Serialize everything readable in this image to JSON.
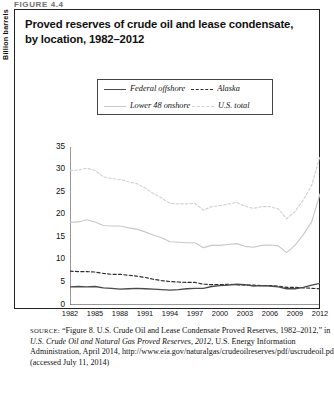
{
  "figure_label": "FIGURE 4.4",
  "chart_title": "Proved reserves of crude oil and lease condensate, by location, 1982–2012",
  "legend": {
    "items": [
      {
        "label": "Federal offshore",
        "style": "solid",
        "color": "#4a4a4a",
        "width": 1.4
      },
      {
        "label": "Alaska",
        "style": "dashed",
        "color": "#2e2e2e",
        "width": 1.2
      },
      {
        "label": "Lower 48 onshore",
        "style": "solid",
        "color": "#c8c8c8",
        "width": 1.2
      },
      {
        "label": "U.S. total",
        "style": "dotted",
        "color": "#d2d2d2",
        "width": 1.2
      }
    ]
  },
  "axes": {
    "ylabel": "Billion barrels",
    "yticks": [
      0,
      5,
      10,
      15,
      20,
      25,
      30,
      35
    ],
    "ylim": [
      0,
      35
    ],
    "xticks": [
      "1982",
      "1985",
      "1988",
      "1991",
      "1994",
      "1997",
      "2000",
      "2003",
      "2006",
      "2009",
      "2012"
    ],
    "xlim": [
      1982,
      2012
    ]
  },
  "source": {
    "prefix": "SOURCE:",
    "line1": " “Figure 8. U.S. Crude Oil and Lease Condensate Proved Reserves, 1982–2012,” in ",
    "italic1": "U.S. Crude Oil and Natural Gas Proved Reserves, 2012",
    "line2": ", U.S. Energy Information Administration, April 2014, http://www.eia.gov/naturalgas/crudeoilreserves/pdf/uscrudeoil.pdf (accessed July 11, 2014)"
  },
  "chart_data": {
    "type": "line",
    "title": "Proved reserves of crude oil and lease condensate, by location, 1982–2012",
    "xlabel": "",
    "ylabel": "Billion barrels",
    "ylim": [
      0,
      35
    ],
    "xlim": [
      1982,
      2012
    ],
    "grid": false,
    "legend_position": "top-center",
    "x": [
      1982,
      1983,
      1984,
      1985,
      1986,
      1987,
      1988,
      1989,
      1990,
      1991,
      1992,
      1993,
      1994,
      1995,
      1996,
      1997,
      1998,
      1999,
      2000,
      2001,
      2002,
      2003,
      2004,
      2005,
      2006,
      2007,
      2008,
      2009,
      2010,
      2011,
      2012
    ],
    "series": [
      {
        "name": "U.S. total",
        "style": "dotted",
        "color": "#d2d2d2",
        "values": [
          29.8,
          29.9,
          30.3,
          29.8,
          28.4,
          28.0,
          27.8,
          27.3,
          26.9,
          25.9,
          24.7,
          23.7,
          22.5,
          22.4,
          22.4,
          22.5,
          21.0,
          21.8,
          22.0,
          22.4,
          22.7,
          21.9,
          21.4,
          21.8,
          21.8,
          21.3,
          19.1,
          20.7,
          23.3,
          26.5,
          33.0
        ]
      },
      {
        "name": "Lower 48 onshore",
        "style": "solid",
        "color": "#c8c8c8",
        "values": [
          18.3,
          18.4,
          18.9,
          18.4,
          17.6,
          17.5,
          17.5,
          17.1,
          16.8,
          16.2,
          15.5,
          14.9,
          14.0,
          13.9,
          13.8,
          13.8,
          12.7,
          13.2,
          13.2,
          13.4,
          13.6,
          13.0,
          12.8,
          13.2,
          13.3,
          13.1,
          11.6,
          13.2,
          15.6,
          18.4,
          24.6
        ]
      },
      {
        "name": "Alaska",
        "style": "dashed",
        "color": "#2e2e2e",
        "values": [
          7.5,
          7.4,
          7.4,
          7.3,
          7.0,
          6.8,
          6.8,
          6.6,
          6.4,
          6.1,
          5.7,
          5.4,
          5.2,
          5.1,
          5.0,
          5.0,
          4.6,
          4.5,
          4.5,
          4.6,
          4.5,
          4.4,
          4.4,
          4.3,
          4.3,
          4.2,
          3.9,
          3.9,
          3.8,
          3.7,
          3.6
        ]
      },
      {
        "name": "Federal offshore",
        "style": "solid",
        "color": "#4a4a4a",
        "values": [
          4.0,
          4.1,
          4.0,
          4.1,
          3.8,
          3.7,
          3.5,
          3.6,
          3.7,
          3.6,
          3.5,
          3.4,
          3.3,
          3.4,
          3.6,
          3.7,
          3.7,
          4.1,
          4.3,
          4.4,
          4.6,
          4.5,
          4.2,
          4.3,
          4.2,
          4.0,
          3.6,
          3.6,
          3.9,
          4.4,
          4.8
        ]
      }
    ]
  }
}
